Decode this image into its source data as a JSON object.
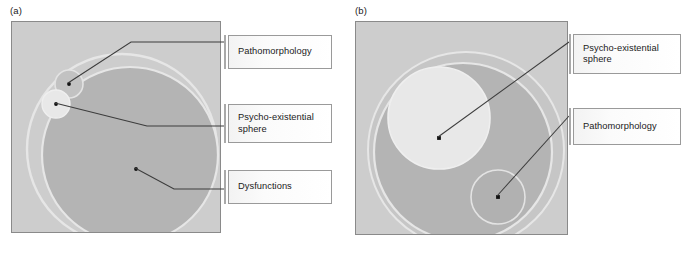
{
  "figure": {
    "background": "#ffffff",
    "palette": {
      "plot_background": "#cdcdcd",
      "outer_circle": "#c2c2c2",
      "inner_circle": "#b4b4b4",
      "light_circle": "#e8e8e8",
      "ring_stroke": "#e4e4e4",
      "box_border": "#9a9a9a",
      "accent_bar": "#a9a9a9",
      "leader_line": "#3c3c3c",
      "text": "#1b1b1b"
    }
  },
  "panels": [
    {
      "id": "a",
      "label": "(a)",
      "shapes": [
        {
          "name": "dysfunctions-circle",
          "cx": 118,
          "cy": 133,
          "r": 88,
          "fill": "#b4b4b4"
        },
        {
          "name": "psycho-existential-outer-circle",
          "cx": 110,
          "cy": 127,
          "r": 95,
          "fill": "none"
        },
        {
          "name": "pathomorphology-small-circle",
          "cx": 57,
          "cy": 62,
          "r": 14,
          "fill": "#c2c2c2"
        },
        {
          "name": "psycho-existential-small-circle",
          "cx": 44,
          "cy": 82,
          "r": 14,
          "fill": "#e8e8e8"
        }
      ],
      "markers": [
        {
          "name": "pathomorphology-marker",
          "x": 57,
          "y": 62
        },
        {
          "name": "psycho-existential-marker",
          "x": 44,
          "y": 82
        },
        {
          "name": "dysfunctions-marker",
          "x": 124,
          "y": 147
        }
      ],
      "callouts": [
        {
          "name": "callout-pathomorphology",
          "text": "Pathomorphology"
        },
        {
          "name": "callout-psycho-existential-sphere",
          "text": "Psycho-existential\nsphere"
        },
        {
          "name": "callout-dysfunctions",
          "text": "Dysfunctions"
        }
      ]
    },
    {
      "id": "b",
      "label": "(b)",
      "shapes": [
        {
          "name": "outer-ring-circle",
          "cx": 110,
          "cy": 128,
          "r": 98,
          "fill": "#c2c2c2"
        },
        {
          "name": "dysfunctions-circle",
          "cx": 107,
          "cy": 130,
          "r": 89,
          "fill": "#b4b4b4"
        },
        {
          "name": "psycho-existential-sphere-circle",
          "cx": 83,
          "cy": 96,
          "r": 51,
          "fill": "#e8e8e8"
        },
        {
          "name": "pathomorphology-circle",
          "cx": 142,
          "cy": 175,
          "r": 27,
          "fill": "#b4b4b4"
        }
      ],
      "markers": [
        {
          "name": "psycho-existential-marker",
          "x": 83,
          "y": 116
        },
        {
          "name": "pathomorphology-marker",
          "x": 142,
          "y": 175
        }
      ],
      "callouts": [
        {
          "name": "callout-psycho-existential-sphere",
          "text": "Psycho-existential\nsphere"
        },
        {
          "name": "callout-pathomorphology",
          "text": "Pathomorphology"
        }
      ]
    }
  ]
}
